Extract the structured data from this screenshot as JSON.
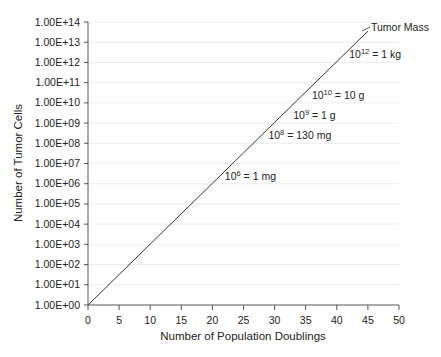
{
  "chart_data": {
    "type": "line",
    "title": "",
    "xlabel": "Number of Population Doublings",
    "ylabel": "Number of Tumor Cells",
    "x_scale": "linear",
    "y_scale": "log",
    "xlim": [
      0,
      50
    ],
    "ylim": [
      1,
      100000000000000.0
    ],
    "x_ticks": [
      0,
      5,
      10,
      15,
      20,
      25,
      30,
      35,
      40,
      45,
      50
    ],
    "y_ticks": [
      "1.00E+00",
      "1.00E+01",
      "1.00E+02",
      "1.00E+03",
      "1.00E+04",
      "1.00E+05",
      "1.00E+06",
      "1.00E+07",
      "1.00E+08",
      "1.00E+09",
      "1.00E+10",
      "1.00E+11",
      "1.00E+12",
      "1.00E+13",
      "1.00E+14"
    ],
    "grid": {
      "horizontal": true,
      "vertical": false
    },
    "series": [
      {
        "name": "Tumor Mass",
        "formula": "y = 2^x",
        "x": [
          0,
          5,
          10,
          15,
          20,
          25,
          30,
          35,
          40,
          45
        ],
        "values": [
          1,
          32,
          1024,
          32768,
          1048576,
          33554432,
          1073741824,
          34359738368,
          1099511627776,
          35184372088832
        ],
        "color": "#333333"
      }
    ],
    "annotations": [
      {
        "base": "10",
        "exp": "12",
        "text": " = 1 kg",
        "x": 42,
        "y_log": 12.4
      },
      {
        "base": "10",
        "exp": "10",
        "text": " = 10 g",
        "x": 36,
        "y_log": 10.4
      },
      {
        "base": "10",
        "exp": "9",
        "text": " = 1 g",
        "x": 33,
        "y_log": 9.4
      },
      {
        "base": "10",
        "exp": "8",
        "text": " = 130 mg",
        "x": 29,
        "y_log": 8.4
      },
      {
        "base": "10",
        "exp": "6",
        "text": " = 1 mg",
        "x": 22,
        "y_log": 6.4
      }
    ],
    "series_label": "Tumor Mass"
  }
}
